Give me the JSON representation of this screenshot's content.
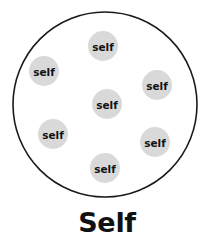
{
  "diagram": {
    "caption": "Self",
    "boundary": {
      "name": "self-boundary-circle",
      "cx": 105,
      "cy": 104.5,
      "rx": 92,
      "ry": 92.5,
      "stroke_color": "#1a1a1a",
      "fill_color": "#ffffff"
    },
    "node_fill_color": "#d9d9d9",
    "text_color": "#111111",
    "background_color": "#ffffff",
    "nodes": [
      {
        "label": "self",
        "cx": 103,
        "cy": 46,
        "r": 15
      },
      {
        "label": "self",
        "cx": 44,
        "cy": 71,
        "r": 15
      },
      {
        "label": "self",
        "cx": 157,
        "cy": 85,
        "r": 15
      },
      {
        "label": "self",
        "cx": 107,
        "cy": 104,
        "r": 15
      },
      {
        "label": "self",
        "cx": 53,
        "cy": 134,
        "r": 15
      },
      {
        "label": "self",
        "cx": 155,
        "cy": 142,
        "r": 15
      },
      {
        "label": "self",
        "cx": 105,
        "cy": 168,
        "r": 15
      }
    ],
    "caption_position": {
      "x": 107,
      "y": 232
    }
  }
}
